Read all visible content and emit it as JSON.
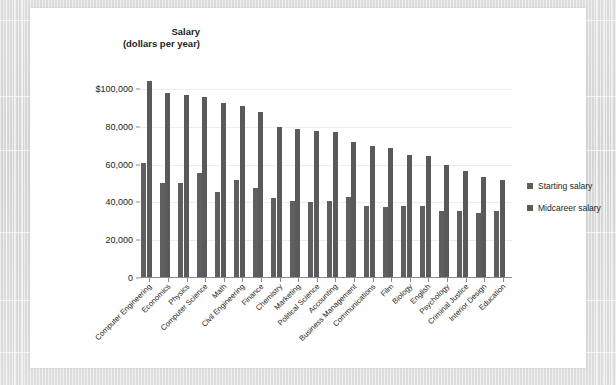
{
  "chart_data": {
    "type": "bar",
    "title": "",
    "ylabel_line1": "Salary",
    "ylabel_line2": "(dollars per year)",
    "xlabel": "",
    "ylim": [
      0,
      110000
    ],
    "grid": true,
    "legend_position": "right",
    "y_ticks": [
      {
        "value": 0,
        "label": "0"
      },
      {
        "value": 20000,
        "label": "20,000"
      },
      {
        "value": 40000,
        "label": "40,000"
      },
      {
        "value": 60000,
        "label": "60,000"
      },
      {
        "value": 80000,
        "label": "80,000"
      },
      {
        "value": 100000,
        "label": "$100,000"
      }
    ],
    "categories": [
      "Computer Engineering",
      "Economics",
      "Physics",
      "Computer Science",
      "Math",
      "Civil Engineering",
      "Finance",
      "Chemistry",
      "Marketing",
      "Political Science",
      "Accounting",
      "Business Management",
      "Communications",
      "Film",
      "Biology",
      "English",
      "Psychology",
      "Criminal Justice",
      "Interior Design",
      "Education"
    ],
    "series": [
      {
        "name": "Starting salary",
        "color": "#5f5f5f",
        "values": [
          61000,
          50000,
          50500,
          55500,
          45500,
          52000,
          47500,
          42500,
          40500,
          40000,
          40500,
          43000,
          38000,
          37500,
          38000,
          38000,
          35500,
          35500,
          34500,
          35500
        ]
      },
      {
        "name": "Midcareer salary",
        "color": "#5a5a5a",
        "values": [
          104000,
          98000,
          97000,
          95500,
          92500,
          91000,
          88000,
          80000,
          79000,
          78000,
          77000,
          72000,
          70000,
          68500,
          65000,
          64500,
          60000,
          56500,
          53500,
          52000
        ]
      }
    ]
  },
  "legend": {
    "items": [
      {
        "label": "Starting salary",
        "color": "#5f5f5f"
      },
      {
        "label": "Midcareer salary",
        "color": "#5a5a5a"
      }
    ]
  }
}
